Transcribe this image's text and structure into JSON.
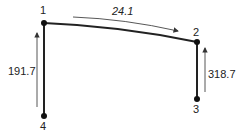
{
  "diagram": {
    "type": "frame-flow",
    "nodes": [
      {
        "id": "1",
        "label": "1",
        "x": 44,
        "y": 23
      },
      {
        "id": "2",
        "label": "2",
        "x": 197,
        "y": 42
      },
      {
        "id": "3",
        "label": "3",
        "x": 197,
        "y": 99
      },
      {
        "id": "4",
        "label": "4",
        "x": 44,
        "y": 116
      }
    ],
    "members": [
      {
        "from": "1",
        "to": "2"
      },
      {
        "from": "2",
        "to": "3"
      },
      {
        "from": "4",
        "to": "1"
      }
    ],
    "flows": [
      {
        "member": "1-2",
        "value": "24.1",
        "direction": "1 to 2"
      },
      {
        "member": "3-2",
        "value": "318.7",
        "direction": "3 to 2"
      },
      {
        "member": "4-1",
        "value": "191.7",
        "direction": "4 to 1"
      }
    ],
    "colors": {
      "line": "#222222",
      "background": "#ffffff"
    }
  }
}
